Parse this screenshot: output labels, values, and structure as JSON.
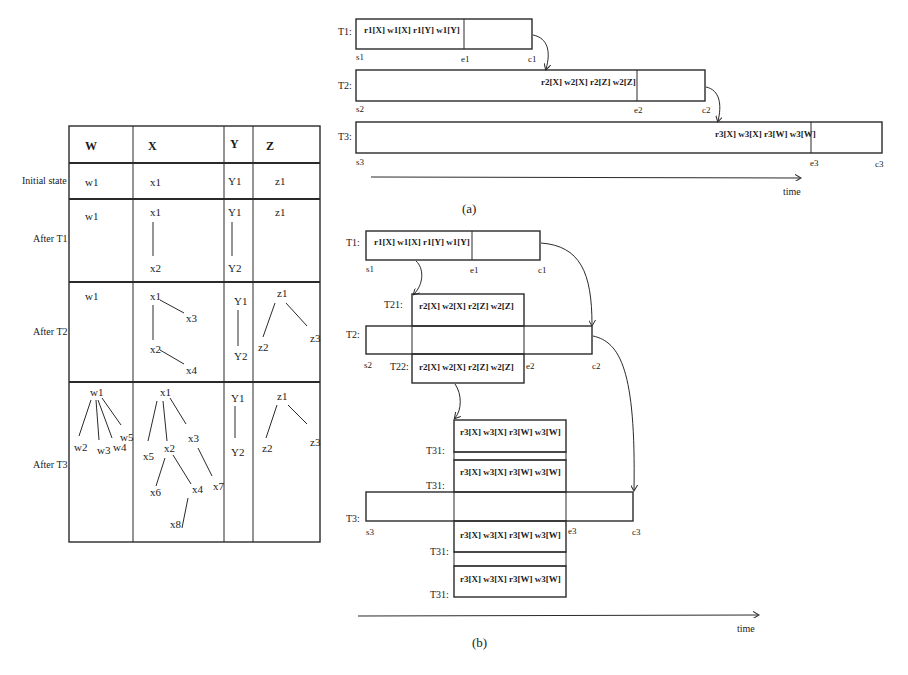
{
  "table": {
    "headers": [
      "W",
      "X",
      "Y",
      "Z"
    ],
    "rows": [
      {
        "label": "Initial state",
        "W": "w1",
        "X": "x1",
        "Y": "Y1",
        "Z": "z1"
      },
      {
        "label": "After T1"
      },
      {
        "label": "After T2"
      },
      {
        "label": "After T3"
      }
    ],
    "after_t1": {
      "W": [
        "w1"
      ],
      "X": [
        "x1",
        "x2"
      ],
      "Y": [
        "Y1",
        "Y2"
      ],
      "Z": [
        "z1"
      ]
    },
    "after_t2": {
      "W": [
        "w1"
      ],
      "X": [
        "x1",
        "x2",
        "x3",
        "x4"
      ],
      "Y": [
        "Y1",
        "Y2"
      ],
      "Z": [
        "z1",
        "z2",
        "z3"
      ]
    },
    "after_t3": {
      "W": [
        "w1",
        "w2",
        "w3",
        "w4",
        "w5"
      ],
      "X": [
        "x1",
        "x2",
        "x3",
        "x4",
        "x5",
        "x6",
        "x7",
        "x8"
      ],
      "Y": [
        "Y1",
        "Y2"
      ],
      "Z": [
        "z1",
        "z2",
        "z3"
      ]
    }
  },
  "diagram_a": {
    "caption": "(a)",
    "time_label": "time",
    "transactions": [
      {
        "name": "T1:",
        "ops": "r1[X] w1[X] r1[Y] w1[Y]",
        "start": "s1",
        "end": "e1",
        "commit": "c1"
      },
      {
        "name": "T2:",
        "ops": "r2[X] w2[X] r2[Z] w2[Z]",
        "start": "s2",
        "end": "e2",
        "commit": "c2"
      },
      {
        "name": "T3:",
        "ops": "r3[X] w3[X] r3[W] w3[W]",
        "start": "s3",
        "end": "e3",
        "commit": "c3"
      }
    ]
  },
  "diagram_b": {
    "caption": "(b)",
    "time_label": "time",
    "t1": {
      "name": "T1:",
      "ops": "r1[X] w1[X] r1[Y] w1[Y]",
      "start": "s1",
      "end": "e1",
      "commit": "c1"
    },
    "t2": {
      "name": "T2:",
      "start": "s2",
      "end": "e2",
      "commit": "c2"
    },
    "t2_subs": [
      {
        "name": "T21:",
        "ops": "r2[X] w2[X] r2[Z] w2[Z]"
      },
      {
        "name": "T22:",
        "ops": "r2[X] w2[X] r2[Z] w2[Z]"
      }
    ],
    "t3": {
      "name": "T3:",
      "start": "s3",
      "end": "e3",
      "commit": "c3"
    },
    "t3_subs": [
      {
        "name": "T31:",
        "ops": "r3[X] w3[X] r3[W] w3[W]"
      },
      {
        "name": "T31:",
        "ops": "r3[X] w3[X] r3[W] w3[W]"
      },
      {
        "name": "T31:",
        "ops": "r3[X] w3[X] r3[W] w3[W]"
      },
      {
        "name": "T31:",
        "ops": "r3[X] w3[X] r3[W] w3[W]"
      }
    ]
  }
}
